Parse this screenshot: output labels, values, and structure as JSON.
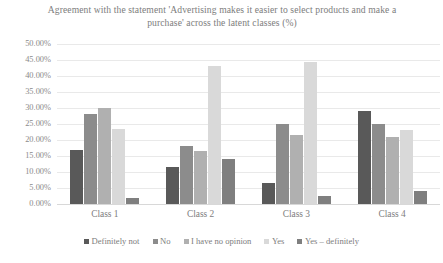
{
  "chart_data": {
    "type": "bar",
    "title": "Agreement with the statement 'Advertising makes it easier to select products and make a purchase' across the latent classes (%)",
    "xlabel": "",
    "ylabel": "",
    "ylim": [
      0,
      50
    ],
    "ytick_labels": [
      "50.00%",
      "45.00%",
      "40.00%",
      "35.00%",
      "30.00%",
      "25.00%",
      "20.00%",
      "15.00%",
      "10.00%",
      "5.00%",
      "0.00%"
    ],
    "ytick_values": [
      50,
      45,
      40,
      35,
      30,
      25,
      20,
      15,
      10,
      5,
      0
    ],
    "grid": true,
    "legend_position": "bottom",
    "categories": [
      "Class 1",
      "Class 2",
      "Class 3",
      "Class 4"
    ],
    "series": [
      {
        "name": "Definitely not",
        "color": "#595959",
        "values": [
          17.0,
          11.5,
          6.5,
          29.0
        ]
      },
      {
        "name": "No",
        "color": "#8c8c8c",
        "values": [
          28.0,
          18.0,
          25.0,
          25.0
        ]
      },
      {
        "name": "I have no opinion",
        "color": "#b0b0b0",
        "values": [
          30.0,
          16.5,
          21.5,
          21.0
        ]
      },
      {
        "name": "Yes",
        "color": "#d9d9d9",
        "values": [
          23.5,
          43.0,
          44.5,
          23.0
        ]
      },
      {
        "name": "Yes – definitely",
        "color": "#7f7f7f",
        "values": [
          2.0,
          14.0,
          2.5,
          4.0
        ]
      }
    ]
  }
}
